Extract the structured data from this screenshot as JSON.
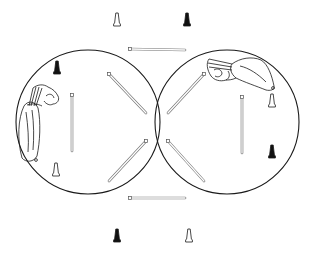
{
  "diagram": {
    "type": "two-arena line drawing",
    "colors": {
      "stroke": "#1a1a1a",
      "background": "#ffffff",
      "pin_dark": "#111111",
      "pin_light": "#ffffff"
    },
    "arenas": [
      {
        "name": "left-arena",
        "cx": 88,
        "cy": 122,
        "r": 72
      },
      {
        "name": "right-arena",
        "cx": 227,
        "cy": 122,
        "r": 72
      }
    ],
    "pins": [
      {
        "name": "pin-top-left-outline",
        "x": 117,
        "y": 20,
        "filled": false
      },
      {
        "name": "pin-top-right-filled",
        "x": 187,
        "y": 20,
        "filled": true
      },
      {
        "name": "pin-left-arena-filled",
        "x": 57,
        "y": 68,
        "filled": true
      },
      {
        "name": "pin-left-arena-outline",
        "x": 56,
        "y": 170,
        "filled": false
      },
      {
        "name": "pin-right-arena-outline",
        "x": 272,
        "y": 101,
        "filled": false
      },
      {
        "name": "pin-right-arena-filled",
        "x": 272,
        "y": 152,
        "filled": true
      },
      {
        "name": "pin-bottom-left-filled",
        "x": 117,
        "y": 236,
        "filled": true
      },
      {
        "name": "pin-bottom-right-outline",
        "x": 189,
        "y": 236,
        "filled": false
      }
    ],
    "rods": [
      {
        "name": "rod-top-horizontal",
        "x1": 130,
        "y1": 49,
        "x2": 185,
        "y2": 50
      },
      {
        "name": "rod-bottom-horizontal",
        "x1": 130,
        "y1": 198,
        "x2": 185,
        "y2": 198
      },
      {
        "name": "rod-left-vertical",
        "x1": 72,
        "y1": 95,
        "x2": 72,
        "y2": 151
      },
      {
        "name": "rod-right-vertical",
        "x1": 242,
        "y1": 97,
        "x2": 242,
        "y2": 153
      },
      {
        "name": "rod-left-upper-diagonal",
        "x1": 109,
        "y1": 74,
        "x2": 146,
        "y2": 113
      },
      {
        "name": "rod-left-lower-diagonal",
        "x1": 146,
        "y1": 141,
        "x2": 109,
        "y2": 181
      },
      {
        "name": "rod-right-upper-diagonal",
        "x1": 204,
        "y1": 74,
        "x2": 168,
        "y2": 113
      },
      {
        "name": "rod-right-lower-diagonal",
        "x1": 168,
        "y1": 141,
        "x2": 204,
        "y2": 181
      }
    ],
    "figures": [
      {
        "name": "left-arm-hand-figure",
        "x": 16,
        "y": 82
      },
      {
        "name": "right-arm-hand-figure",
        "x": 205,
        "y": 57
      }
    ]
  }
}
